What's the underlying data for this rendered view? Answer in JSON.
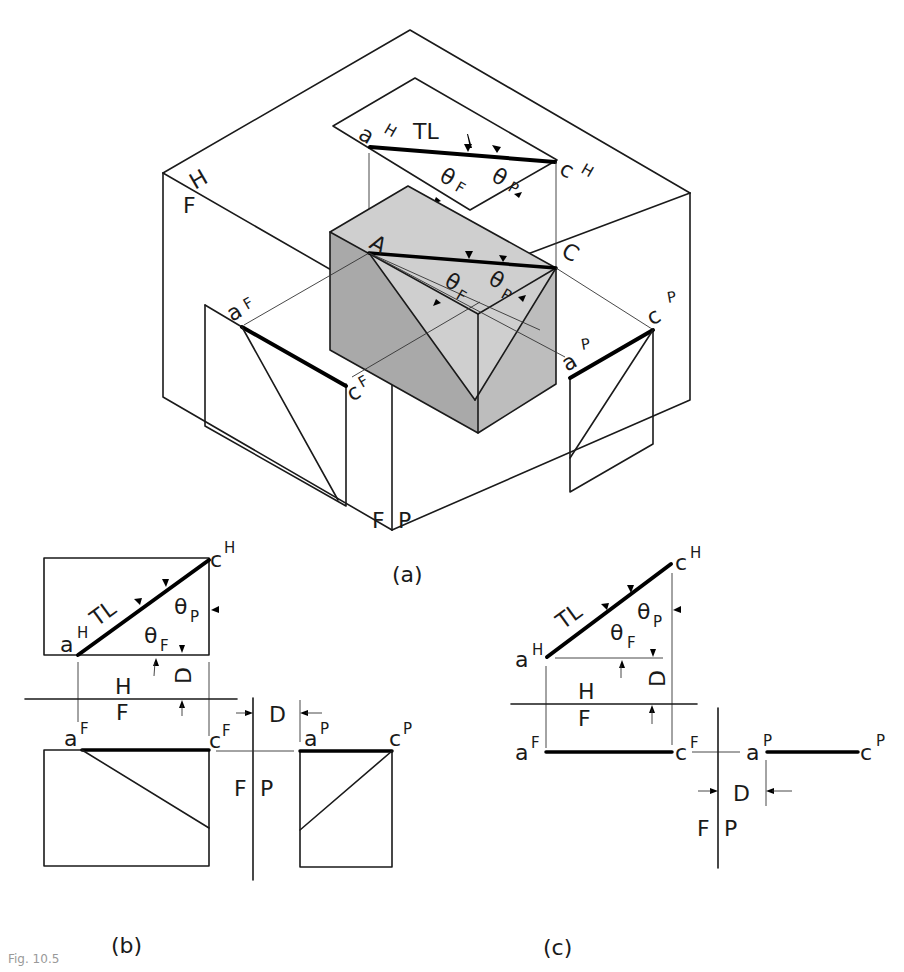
{
  "figure": {
    "caption": "Fig. 10.5",
    "panels": [
      {
        "id": "a",
        "label": "(a)",
        "description": "Pictorial view of a block inside a glass box with horizontal, frontal and profile projection planes"
      },
      {
        "id": "b",
        "label": "(b)",
        "description": "Orthographic views of line AC (top, front, right side) with reference lines"
      },
      {
        "id": "c",
        "label": "(c)",
        "description": "Line-only orthographic views of AC showing true length and angles"
      }
    ]
  },
  "panel_a": {
    "plane_labels": {
      "h": "H",
      "f": "F",
      "f2": "F",
      "p": "P"
    },
    "points": {
      "A": "A",
      "C": "C"
    },
    "top_view": {
      "a": "a",
      "a_sup": "H",
      "c": "c",
      "c_sup": "H",
      "true_length": "TL",
      "theta_f": "θ",
      "theta_f_sub": "F",
      "theta_p": "θ",
      "theta_p_sub": "P"
    },
    "block_angles": {
      "theta_f": "θ",
      "theta_f_sub": "F",
      "theta_p": "θ",
      "theta_p_sub": "P"
    },
    "front_view": {
      "a": "a",
      "a_sup": "F",
      "c": "c",
      "c_sup": "F"
    },
    "profile_view": {
      "a": "a",
      "a_sup": "P",
      "c": "c",
      "c_sup": "P"
    }
  },
  "panel_b": {
    "top": {
      "a": "a",
      "a_sup": "H",
      "c": "c",
      "c_sup": "H",
      "true_length": "TL",
      "theta_f": "θ",
      "theta_f_sub": "F",
      "theta_p": "θ",
      "theta_p_sub": "P",
      "depth": "D"
    },
    "fold_hf": {
      "upper": "H",
      "lower": "F"
    },
    "fold_fp": {
      "left": "F",
      "right": "P"
    },
    "depth_profile": "D",
    "front": {
      "a": "a",
      "a_sup": "F",
      "c": "c",
      "c_sup": "F"
    },
    "profile": {
      "a": "a",
      "a_sup": "P",
      "c": "c",
      "c_sup": "P"
    }
  },
  "panel_c": {
    "top": {
      "a": "a",
      "a_sup": "H",
      "c": "c",
      "c_sup": "H",
      "true_length": "TL",
      "theta_f": "θ",
      "theta_f_sub": "F",
      "theta_p": "θ",
      "theta_p_sub": "P",
      "depth": "D"
    },
    "fold_hf": {
      "upper": "H",
      "lower": "F"
    },
    "fold_fp": {
      "left": "F",
      "right": "P"
    },
    "depth_profile": "D",
    "front": {
      "a": "a",
      "a_sup": "F",
      "c": "c",
      "c_sup": "F"
    },
    "profile": {
      "a": "a",
      "a_sup": "P",
      "c": "c",
      "c_sup": "P"
    }
  },
  "colors": {
    "line": "#1a1a1a",
    "shade_dark": "#a9a9a9",
    "shade_mid": "#bdbdbd",
    "shade_light": "#cfcfcf",
    "background": "#ffffff"
  }
}
